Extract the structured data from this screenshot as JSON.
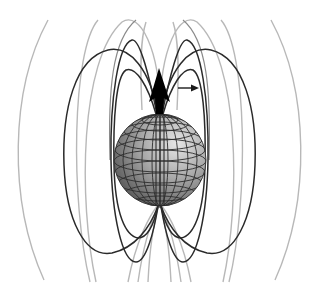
{
  "figure": {
    "colors": {
      "background": "#ffffff",
      "dark_field_line": "#2a2a2a",
      "light_field_line": "#b8b8b8",
      "sphere_light": "#d8d8d8",
      "sphere_dark": "#4a4a4a",
      "arrow": "#000000"
    },
    "elements": {
      "sphere": "globe with latitude/longitude grid",
      "dipole_arrow": "large black arrow pointing up from north pole",
      "field_direction_arrow": "small arrow pointing right",
      "field_lines": "closed loops of dipole field, dark inner and light outer"
    }
  }
}
